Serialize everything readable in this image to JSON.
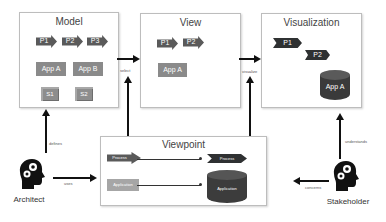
{
  "boxes": {
    "model": {
      "title": "Model",
      "processes": [
        "P1",
        "P2",
        "P3"
      ],
      "applications": [
        "App A",
        "App B"
      ],
      "stakeholders_cubes": [
        "S1",
        "S2"
      ]
    },
    "view": {
      "title": "View",
      "processes": [
        "P1",
        "P2"
      ],
      "applications": [
        "App A"
      ]
    },
    "visualization": {
      "title": "Visualization",
      "processes": [
        "P1",
        "P2"
      ],
      "database": "App A"
    },
    "viewpoint": {
      "title": "Viewpoint",
      "process_source": "Process",
      "process_target": "Process",
      "application_source": "Application",
      "application_target": "Application"
    }
  },
  "actors": {
    "architect": "Architect",
    "stakeholder": "Stakeholder"
  },
  "edges": {
    "model_to_view": "select",
    "view_to_visualization": "visualize",
    "architect_to_model": "defines",
    "architect_to_viewpoint": "uses",
    "stakeholder_to_visualization": "understands",
    "stakeholder_to_viewpoint": "concerns"
  },
  "colors": {
    "process_arrow": "#5a5a5a",
    "chevron": "#2f3132",
    "application": "#8a8a8a",
    "database": "#3a3a3a",
    "border": "#bdbdbd"
  }
}
